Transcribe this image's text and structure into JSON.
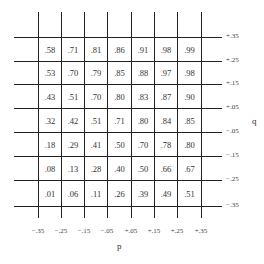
{
  "chart_data": {
    "type": "table",
    "title": "",
    "xlabel": "p",
    "ylabel": "q",
    "x_ticks": [
      "−.35",
      "−.25",
      "−.15",
      "−.05",
      "+.05",
      "+.15",
      "+.25",
      "+.35"
    ],
    "y_ticks": [
      "+.35",
      "+.25",
      "+.15",
      "+.05",
      "−.05",
      "−.15",
      "−.25",
      "−.35"
    ],
    "x_bins": [
      "−.35 to −.25",
      "−.25 to −.15",
      "−.15 to −.05",
      "−.05 to +.05",
      "+.05 to +.15",
      "+.15 to +.25",
      "+.25 to +.35"
    ],
    "y_bins": [
      "+.35 to +.25",
      "+.25 to +.15",
      "+.15 to +.05",
      "+.05 to −.05",
      "−.05 to −.15",
      "−.15 to −.25",
      "−.25 to −.35"
    ],
    "values": [
      [
        ".58",
        ".71",
        ".81",
        ".86",
        ".91",
        ".98",
        ".99"
      ],
      [
        ".53",
        ".70",
        ".79",
        ".85",
        ".88",
        ".97",
        ".98"
      ],
      [
        ".43",
        ".51",
        ".70",
        ".80",
        ".83",
        ".87",
        ".90"
      ],
      [
        ".32",
        ".42",
        ".51",
        ".71",
        ".80",
        ".84",
        ".85"
      ],
      [
        ".18",
        ".29",
        ".41",
        ".50",
        ".70",
        ".78",
        ".80"
      ],
      [
        ".08",
        ".13",
        ".28",
        ".40",
        ".50",
        ".66",
        ".67"
      ],
      [
        ".01",
        ".06",
        ".11",
        ".26",
        ".39",
        ".49",
        ".51"
      ]
    ],
    "grid": true
  }
}
